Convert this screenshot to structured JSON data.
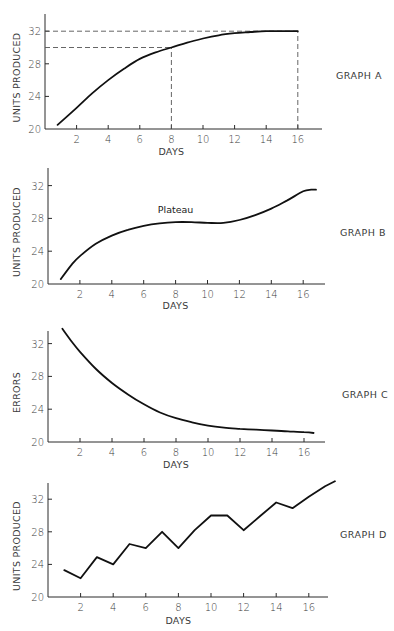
{
  "figure": {
    "graphs": [
      {
        "id": "A",
        "label": "GRAPH A",
        "ylabel": "UNITS PRODUCED",
        "xlabel": "DAYS"
      },
      {
        "id": "B",
        "label": "GRAPH B",
        "ylabel": "UNITS PRODUCED",
        "xlabel": "DAYS",
        "annotation": "Plateau"
      },
      {
        "id": "C",
        "label": "GRAPH C",
        "ylabel": "ERRORS",
        "xlabel": "DAYS"
      },
      {
        "id": "D",
        "label": "GRAPH D",
        "ylabel": "UNITS PRODUCED",
        "xlabel": "DAYS"
      }
    ]
  },
  "chart_data": [
    {
      "type": "line",
      "title": "GRAPH A",
      "xlabel": "DAYS",
      "ylabel": "UNITS PRODUCED",
      "xticks": [
        2,
        4,
        6,
        8,
        10,
        12,
        14,
        16
      ],
      "yticks": [
        20,
        24,
        28,
        32
      ],
      "xlim": [
        0,
        17.5
      ],
      "ylim": [
        20,
        34
      ],
      "grid": false,
      "x": [
        0.8,
        2,
        3,
        4,
        5,
        6,
        7,
        8,
        9,
        10,
        11,
        12,
        13,
        14,
        15,
        16
      ],
      "values": [
        20.5,
        22.6,
        24.4,
        26.0,
        27.4,
        28.6,
        29.4,
        30.0,
        30.6,
        31.1,
        31.5,
        31.75,
        31.9,
        32.0,
        32.0,
        32.0
      ],
      "reference_lines": [
        {
          "type": "horizontal",
          "y": 32,
          "x_from": 0,
          "x_to": 16,
          "style": "dashed"
        },
        {
          "type": "horizontal",
          "y": 30,
          "x_from": 0,
          "x_to": 8,
          "style": "dashed"
        },
        {
          "type": "vertical",
          "x": 8,
          "y_from": 20,
          "y_to": 30,
          "style": "dashed"
        },
        {
          "type": "vertical",
          "x": 16,
          "y_from": 20,
          "y_to": 32,
          "style": "dashed"
        }
      ]
    },
    {
      "type": "line",
      "title": "GRAPH B",
      "xlabel": "DAYS",
      "ylabel": "UNITS PRODUCED",
      "xticks": [
        2,
        4,
        6,
        8,
        10,
        12,
        14,
        16
      ],
      "yticks": [
        20,
        24,
        28,
        32
      ],
      "xlim": [
        0,
        17.5
      ],
      "ylim": [
        20,
        34
      ],
      "grid": false,
      "x": [
        0.8,
        1.5,
        2,
        3,
        4,
        5,
        6,
        7,
        8,
        9,
        10,
        11,
        12,
        13,
        14,
        15,
        16,
        16.5,
        16.8
      ],
      "values": [
        20.6,
        22.4,
        23.4,
        24.9,
        25.9,
        26.6,
        27.1,
        27.4,
        27.55,
        27.55,
        27.45,
        27.45,
        27.8,
        28.4,
        29.2,
        30.2,
        31.3,
        31.5,
        31.5
      ],
      "annotations": [
        {
          "text": "Plateau",
          "x": 8,
          "y": 28.6
        }
      ]
    },
    {
      "type": "line",
      "title": "GRAPH C",
      "xlabel": "DAYS",
      "ylabel": "ERRORS",
      "xticks": [
        2,
        4,
        6,
        8,
        10,
        12,
        14,
        16
      ],
      "yticks": [
        20,
        24,
        28,
        32
      ],
      "xlim": [
        0,
        17.5
      ],
      "ylim": [
        20,
        34
      ],
      "grid": false,
      "x": [
        0.9,
        1.5,
        2,
        3,
        4,
        5,
        6,
        7,
        8,
        9,
        10,
        11,
        12,
        13,
        14,
        15,
        16,
        16.6
      ],
      "values": [
        33.8,
        32.2,
        31.0,
        28.9,
        27.2,
        25.8,
        24.6,
        23.6,
        22.9,
        22.4,
        22.0,
        21.75,
        21.6,
        21.5,
        21.4,
        21.3,
        21.2,
        21.1
      ]
    },
    {
      "type": "line",
      "title": "GRAPH D",
      "xlabel": "DAYS",
      "ylabel": "UNITS PRODUCED",
      "xticks": [
        2,
        4,
        6,
        8,
        10,
        12,
        14,
        16
      ],
      "yticks": [
        20,
        24,
        28,
        32
      ],
      "xlim": [
        0,
        18
      ],
      "ylim": [
        20,
        34
      ],
      "grid": false,
      "x": [
        1,
        2,
        3,
        4,
        5,
        6,
        7,
        8,
        9,
        10,
        11,
        12,
        13,
        14,
        15,
        16,
        17,
        17.6
      ],
      "values": [
        23.3,
        22.3,
        24.9,
        24.0,
        26.5,
        26.0,
        28.0,
        26.0,
        28.2,
        30.0,
        30.0,
        28.2,
        29.9,
        31.6,
        30.9,
        32.3,
        33.6,
        34.2
      ]
    }
  ],
  "layout": [
    {
      "x0": 45,
      "px_per_day": 15.8,
      "y_axis_bottom": 129,
      "y_axis_top": 14,
      "px_per_unit": 8.15,
      "x_axis_end": 322,
      "label_x": 336,
      "label_y": 79,
      "ylabel_x": 20,
      "xlabel_y": 155
    },
    {
      "x0": 48,
      "px_per_day": 15.95,
      "y_axis_bottom": 284,
      "y_axis_top": 168,
      "px_per_unit": 8.2,
      "x_axis_end": 325,
      "label_x": 340,
      "label_y": 236,
      "ylabel_x": 20,
      "xlabel_y": 309
    },
    {
      "x0": 48,
      "px_per_day": 16.0,
      "y_axis_bottom": 442,
      "y_axis_top": 331,
      "px_per_unit": 8.2,
      "x_axis_end": 325,
      "label_x": 342,
      "label_y": 398,
      "ylabel_x": 20,
      "xlabel_y": 468
    },
    {
      "x0": 48,
      "px_per_day": 16.3,
      "y_axis_bottom": 597,
      "y_axis_top": 483,
      "px_per_unit": 8.15,
      "x_axis_end": 328,
      "label_x": 340,
      "label_y": 538,
      "ylabel_x": 20,
      "xlabel_y": 624
    }
  ]
}
